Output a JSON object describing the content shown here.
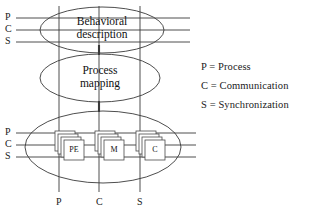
{
  "figure": {
    "type": "layered-abstraction-diagram",
    "background_color": "#ffffff",
    "line_color": "#333333"
  },
  "levels": [
    {
      "id": "behavioral",
      "label_line1": "Behavioral",
      "label_line2": "description"
    },
    {
      "id": "process-mapping",
      "label_line1": "Process",
      "label_line2": "mapping"
    },
    {
      "id": "architecture",
      "label_line1": "",
      "label_line2": ""
    }
  ],
  "axis_labels": {
    "top_left": [
      "P",
      "C",
      "S"
    ],
    "bottom_left": [
      "P",
      "C",
      "S"
    ],
    "bottom": [
      "P",
      "C",
      "S"
    ]
  },
  "components": [
    {
      "id": "pe",
      "label": "PE"
    },
    {
      "id": "m",
      "label": "M"
    },
    {
      "id": "c",
      "label": "C"
    }
  ],
  "legend": [
    {
      "key": "P",
      "eq": "=",
      "value": "Process",
      "text": "P = Process"
    },
    {
      "key": "C",
      "eq": "=",
      "value": "Communication",
      "text": "C = Communication"
    },
    {
      "key": "S",
      "eq": "=",
      "value": "Synchronization",
      "text": "S = Synchronization"
    }
  ]
}
